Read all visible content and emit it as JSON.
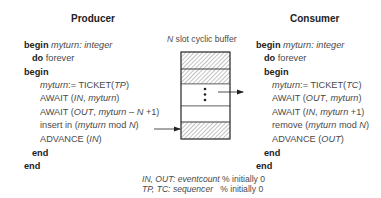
{
  "producer": {
    "title": "Producer",
    "lines": [
      [
        {
          "t": "begin ",
          "s": "kw"
        },
        {
          "t": "myturn",
          "s": "it"
        },
        {
          "t": ": ",
          "s": "it"
        },
        {
          "t": "integer",
          "s": "it"
        }
      ],
      [
        {
          "t": "do ",
          "s": "kw"
        },
        {
          "t": "forever",
          "s": ""
        }
      ],
      [
        {
          "t": "begin",
          "s": "kw"
        }
      ],
      [
        {
          "t": "myturn",
          "s": "it"
        },
        {
          "t": ":= TICKET(",
          "s": ""
        },
        {
          "t": "TP",
          "s": "it"
        },
        {
          "t": ")",
          "s": ""
        }
      ],
      [
        {
          "t": "AWAIT (",
          "s": ""
        },
        {
          "t": "IN",
          "s": "it"
        },
        {
          "t": ", ",
          "s": ""
        },
        {
          "t": "myturn",
          "s": "it"
        },
        {
          "t": ")",
          "s": ""
        }
      ],
      [
        {
          "t": "AWAIT (",
          "s": ""
        },
        {
          "t": "OUT",
          "s": "it"
        },
        {
          "t": ", ",
          "s": ""
        },
        {
          "t": "myturn",
          "s": "it"
        },
        {
          "t": " – ",
          "s": ""
        },
        {
          "t": "N",
          "s": "it"
        },
        {
          "t": " +1)",
          "s": ""
        }
      ],
      [
        {
          "t": "insert in (",
          "s": ""
        },
        {
          "t": "myturn",
          "s": "it"
        },
        {
          "t": " mod ",
          "s": ""
        },
        {
          "t": "N",
          "s": "it"
        },
        {
          "t": ")",
          "s": ""
        }
      ],
      [
        {
          "t": "ADVANCE (",
          "s": ""
        },
        {
          "t": "IN",
          "s": "it"
        },
        {
          "t": ")",
          "s": ""
        }
      ],
      [
        {
          "t": "end",
          "s": "kw"
        }
      ],
      [
        {
          "t": "end",
          "s": "kw"
        }
      ]
    ]
  },
  "consumer": {
    "title": "Consumer",
    "lines": [
      [
        {
          "t": "begin ",
          "s": "kw"
        },
        {
          "t": "myturn",
          "s": "it"
        },
        {
          "t": ": ",
          "s": "it"
        },
        {
          "t": "integer",
          "s": "it"
        }
      ],
      [
        {
          "t": "do ",
          "s": "kw"
        },
        {
          "t": "forever",
          "s": ""
        }
      ],
      [
        {
          "t": "begin",
          "s": "kw"
        }
      ],
      [
        {
          "t": "myturn",
          "s": "it"
        },
        {
          "t": ":= TICKET(",
          "s": ""
        },
        {
          "t": "TC",
          "s": "it"
        },
        {
          "t": ")",
          "s": ""
        }
      ],
      [
        {
          "t": "AWAIT (",
          "s": ""
        },
        {
          "t": "OUT",
          "s": "it"
        },
        {
          "t": ", ",
          "s": ""
        },
        {
          "t": "myturn",
          "s": "it"
        },
        {
          "t": ")",
          "s": ""
        }
      ],
      [
        {
          "t": "AWAIT (",
          "s": ""
        },
        {
          "t": "IN",
          "s": "it"
        },
        {
          "t": ", ",
          "s": ""
        },
        {
          "t": "myturn",
          "s": "it"
        },
        {
          "t": " +1)",
          "s": ""
        }
      ],
      [
        {
          "t": "remove (",
          "s": ""
        },
        {
          "t": "myturn",
          "s": "it"
        },
        {
          "t": " mod ",
          "s": ""
        },
        {
          "t": "N",
          "s": "it"
        },
        {
          "t": ")",
          "s": ""
        }
      ],
      [
        {
          "t": "ADVANCE (",
          "s": ""
        },
        {
          "t": "OUT",
          "s": "it"
        },
        {
          "t": ")",
          "s": ""
        }
      ],
      [
        {
          "t": "end",
          "s": "kw"
        }
      ],
      [
        {
          "t": "end",
          "s": "kw"
        }
      ]
    ]
  },
  "buffer": {
    "caption_var": "N",
    "caption_text": " slot cyclic buffer",
    "slots": [
      "filled",
      "filled",
      "ellipsis",
      "empty",
      "filled"
    ]
  },
  "legend": {
    "line1": {
      "vars": "IN, OUT",
      "type": ": eventcount",
      "comment": " % initially 0"
    },
    "line2": {
      "vars": "TP, TC",
      "type": ": sequencer",
      "comment": "   % initially 0"
    }
  },
  "colors": {
    "text": "#4a4a4a",
    "keyword": "#222222",
    "stroke": "#333333",
    "hatch": "#777777"
  }
}
